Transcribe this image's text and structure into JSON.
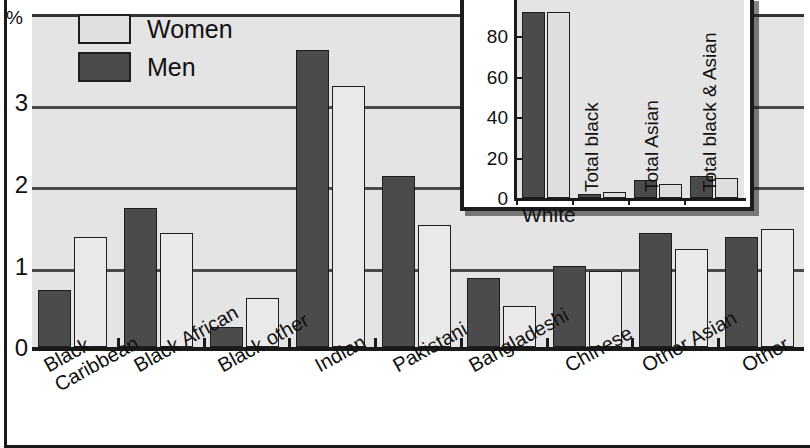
{
  "axis": {
    "unit_symbol": "%",
    "y_ticks": [
      "0",
      "1",
      "2",
      "3"
    ],
    "y_min": 0,
    "y_max": 3.75
  },
  "legend": {
    "women_label": "Women",
    "men_label": "Men"
  },
  "chart_data": {
    "type": "bar",
    "title": "",
    "xlabel": "",
    "ylabel": "%",
    "ylim": [
      0,
      3.75
    ],
    "grid": true,
    "legend_position": "top-left",
    "categories": [
      "Black\nCaribbean",
      "Black African",
      "Black other",
      "Indian",
      "Pakistani",
      "Bangladeshi",
      "Chinese",
      "Other Asian",
      "Other"
    ],
    "series": [
      {
        "name": "Men",
        "values": [
          0.7,
          1.7,
          0.25,
          3.65,
          2.1,
          0.85,
          1.0,
          1.4,
          1.35
        ]
      },
      {
        "name": "Women",
        "values": [
          1.35,
          1.4,
          0.6,
          3.2,
          1.5,
          0.5,
          0.93,
          1.2,
          1.45
        ]
      }
    ]
  },
  "inset": {
    "chart_data": {
      "type": "bar",
      "title": "",
      "xlabel": "",
      "ylabel": "",
      "ylim": [
        0,
        90
      ],
      "grid": false,
      "y_ticks": [
        "0",
        "20",
        "40",
        "60",
        "80"
      ],
      "categories": [
        "White",
        "Total black",
        "Total Asian",
        "Total black & Asian"
      ],
      "series": [
        {
          "name": "Men",
          "values": [
            92,
            2,
            9,
            11
          ]
        },
        {
          "name": "Women",
          "values": [
            92,
            3,
            7,
            10
          ]
        }
      ],
      "notes": "White bars extend past top of inset axis"
    }
  },
  "colors": {
    "men_fill": "#4b4b4b",
    "women_fill": "#e9e9e9",
    "plot_background": "#e4e4e4",
    "axis": "#1a1a1a"
  }
}
